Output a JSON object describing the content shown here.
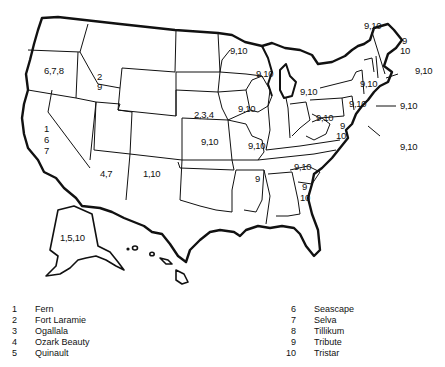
{
  "map": {
    "title": "",
    "state_labels": {
      "oregon": "6,7,8",
      "idaho_1": "2",
      "idaho_2": "9",
      "california_1": "1",
      "california_2": "6",
      "california_3": "7",
      "arizona": "4,7",
      "new_mexico": "1,10",
      "nebraska": "2,3,4",
      "kansas": "9,10",
      "minnesota": "9,10",
      "wisconsin": "9,10",
      "iowa": "9,10",
      "missouri": "9,10",
      "michigan": "9,10",
      "ohio": "9,10",
      "pennsylvania": "9,10",
      "new_york": "9,10",
      "west_virginia_1": "9",
      "west_virginia_2": "10",
      "kentucky": "9,10",
      "arkansas": "9",
      "alabama_1": "9",
      "alabama_2": "10",
      "alaska": "1,5,10",
      "vermont_callout": "9,10",
      "maine_1": "9",
      "maine_2": "10",
      "massachusetts_callout": "9,10",
      "new_jersey_callout": "9,10",
      "delaware_callout": "9,10"
    }
  },
  "legend": {
    "left": [
      {
        "num": "1",
        "name": "Fern"
      },
      {
        "num": "2",
        "name": "Fort Laramie"
      },
      {
        "num": "3",
        "name": "Ogallala"
      },
      {
        "num": "4",
        "name": "Ozark Beauty"
      },
      {
        "num": "5",
        "name": "Quinault"
      }
    ],
    "right": [
      {
        "num": "6",
        "name": "Seascape"
      },
      {
        "num": "7",
        "name": "Selva"
      },
      {
        "num": "8",
        "name": "Tillikum"
      },
      {
        "num": "9",
        "name": "Tribute"
      },
      {
        "num": "10",
        "name": "Tristar"
      }
    ]
  }
}
